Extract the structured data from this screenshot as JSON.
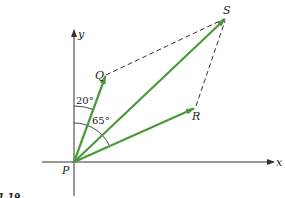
{
  "figure": {
    "caption_fragment": "1.19",
    "colors": {
      "vector": "#4a9a3a",
      "axis": "#333333",
      "dashed": "#333333",
      "background": "#ffffff"
    },
    "axes": {
      "x_label": "x",
      "y_label": "y"
    },
    "points": {
      "origin": {
        "label": "P",
        "x": 74,
        "y": 162
      },
      "Q": {
        "label": "Q",
        "x": 106,
        "y": 75
      },
      "R": {
        "label": "R",
        "x": 195,
        "y": 108
      },
      "S": {
        "label": "S",
        "x": 226,
        "y": 18
      }
    },
    "vectors": [
      {
        "name": "PQ",
        "from": "P",
        "to": "Q"
      },
      {
        "name": "PR",
        "from": "P",
        "to": "R"
      },
      {
        "name": "PS",
        "from": "P",
        "to": "S"
      }
    ],
    "dashed_lines": [
      {
        "from": "Q",
        "to": "S"
      },
      {
        "from": "R",
        "to": "S"
      }
    ],
    "angles": [
      {
        "label": "20°",
        "between": "y-axis and PQ"
      },
      {
        "label": "65°",
        "between": "y-axis and PR"
      }
    ]
  }
}
